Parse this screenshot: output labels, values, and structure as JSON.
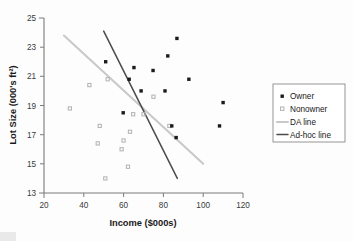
{
  "chart_data": {
    "type": "scatter",
    "title": "",
    "xlabel": "Income ($000s)",
    "ylabel": "Lot Size (000's ft²)",
    "xlim": [
      20,
      120
    ],
    "ylim": [
      13,
      25
    ],
    "xticks": [
      20,
      40,
      60,
      80,
      100,
      120
    ],
    "yticks": [
      13,
      15,
      17,
      19,
      21,
      23,
      25
    ],
    "xtick_labels": [
      "20",
      "40",
      "60",
      "80",
      "100",
      "120"
    ],
    "ytick_labels": [
      "13",
      "15",
      "17",
      "19",
      "21",
      "23",
      "25"
    ],
    "grid": false,
    "legend_position": "right-outside",
    "series": [
      {
        "name": "Owner",
        "marker": "filled-square",
        "color": "#1b1b1b",
        "points": [
          [
            51.0,
            22.0
          ],
          [
            59.8,
            18.5
          ],
          [
            62.8,
            20.8
          ],
          [
            65.2,
            21.6
          ],
          [
            68.8,
            20.0
          ],
          [
            74.8,
            21.4
          ],
          [
            80.8,
            20.0
          ],
          [
            82.2,
            22.4
          ],
          [
            86.8,
            23.6
          ],
          [
            84.2,
            17.6
          ],
          [
            86.4,
            16.8
          ],
          [
            92.8,
            20.8
          ],
          [
            108.2,
            17.6
          ],
          [
            110.0,
            19.2
          ]
        ]
      },
      {
        "name": "Nonowner",
        "marker": "open-square",
        "color": "#b4b4b4",
        "points": [
          [
            33.0,
            18.8
          ],
          [
            42.8,
            20.4
          ],
          [
            47.0,
            16.4
          ],
          [
            48.0,
            17.6
          ],
          [
            50.8,
            14.0
          ],
          [
            52.0,
            20.8
          ],
          [
            59.0,
            16.0
          ],
          [
            60.0,
            16.6
          ],
          [
            62.2,
            14.8
          ],
          [
            63.2,
            17.2
          ],
          [
            64.8,
            18.4
          ],
          [
            70.0,
            18.4
          ],
          [
            75.0,
            19.6
          ],
          [
            83.0,
            17.6
          ]
        ]
      }
    ],
    "lines": [
      {
        "name": "DA line",
        "color": "#c9c9c9",
        "x": [
          30.0,
          100.0
        ],
        "y": [
          23.8,
          15.0
        ]
      },
      {
        "name": "Ad-hoc line",
        "color": "#4a4a4a",
        "x": [
          50.0,
          87.0
        ],
        "y": [
          24.1,
          14.0
        ]
      }
    ],
    "legend": [
      {
        "label": "Owner",
        "type": "marker",
        "marker": "filled-square",
        "color": "#1b1b1b"
      },
      {
        "label": "Nonowner",
        "type": "marker",
        "marker": "open-square",
        "color": "#b4b4b4"
      },
      {
        "label": "DA line",
        "type": "line",
        "color": "#c9c9c9"
      },
      {
        "label": "Ad-hoc line",
        "type": "line",
        "color": "#4a4a4a"
      }
    ]
  }
}
